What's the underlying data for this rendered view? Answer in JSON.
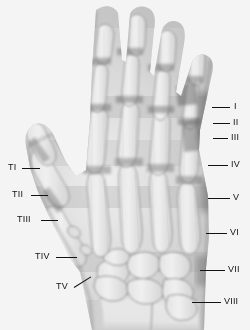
{
  "figure": {
    "type": "radiograph",
    "view": "dorsal-palmar",
    "background_color": "#ffffff",
    "label_color": "#121212",
    "width": 250,
    "height": 330
  },
  "annotations": {
    "thumb_side": [
      {
        "id": "TI",
        "label": "TI",
        "text_x": 8,
        "text_y": 163,
        "line_x": 22,
        "line_y": 168,
        "line_w": 18
      },
      {
        "id": "TII",
        "label": "TII",
        "text_x": 12,
        "text_y": 190,
        "line_x": 31,
        "line_y": 195,
        "line_w": 17
      },
      {
        "id": "TIII",
        "label": "TIII",
        "text_x": 17,
        "text_y": 215,
        "line_x": 41,
        "line_y": 220,
        "line_w": 17
      },
      {
        "id": "TIV",
        "label": "TIV",
        "text_x": 35,
        "text_y": 252,
        "line_x": 56,
        "line_y": 257,
        "line_w": 21
      },
      {
        "id": "TV",
        "label": "TV",
        "text_x": 56,
        "text_y": 282,
        "line_x": 74,
        "line_y": 287,
        "line_w": 16
      }
    ],
    "ulnar_side": [
      {
        "id": "I",
        "label": "I",
        "text_x": 234,
        "text_y": 102,
        "line_x": 212,
        "line_y": 107,
        "line_w": 18
      },
      {
        "id": "II",
        "label": "II",
        "text_x": 233,
        "text_y": 118,
        "line_x": 213,
        "line_y": 123,
        "line_w": 17
      },
      {
        "id": "III",
        "label": "III",
        "text_x": 231,
        "text_y": 133,
        "line_x": 213,
        "line_y": 138,
        "line_w": 15
      },
      {
        "id": "IV",
        "label": "IV",
        "text_x": 231,
        "text_y": 160,
        "line_x": 208,
        "line_y": 165,
        "line_w": 20
      },
      {
        "id": "V",
        "label": "V",
        "text_x": 233,
        "text_y": 193,
        "line_x": 208,
        "line_y": 198,
        "line_w": 22
      },
      {
        "id": "VI",
        "label": "VI",
        "text_x": 230,
        "text_y": 228,
        "line_x": 206,
        "line_y": 233,
        "line_w": 21
      },
      {
        "id": "VII",
        "label": "VII",
        "text_x": 228,
        "text_y": 265,
        "line_x": 200,
        "line_y": 270,
        "line_w": 25
      },
      {
        "id": "VIII",
        "label": "VIII",
        "text_x": 224,
        "text_y": 297,
        "line_x": 192,
        "line_y": 302,
        "line_w": 29
      }
    ]
  },
  "legend_note": {
    "thumb_series_label": "T",
    "digit_series_label": "Roman numerals"
  }
}
